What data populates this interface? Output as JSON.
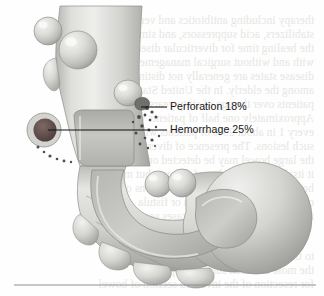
{
  "figure": {
    "name": "diverticular-disease-complications",
    "background_color": "#fefefe",
    "illustration_style": "grayscale medical airbrush illustration"
  },
  "callouts": [
    {
      "id": "perforation",
      "label": "Perforation 18%",
      "value": 18,
      "unit": "%",
      "leader_from": {
        "x": 141,
        "y": 107
      },
      "leader_to": {
        "x": 167,
        "y": 107
      },
      "target": "ruptured diverticulum with spilled contents"
    },
    {
      "id": "hemorrhage",
      "label": "Hemorrhage 25%",
      "value": 25,
      "unit": "%",
      "leader_from": {
        "x": 48,
        "y": 130
      },
      "leader_to": {
        "x": 167,
        "y": 130
      },
      "target": "dark bleeding diverticular lesion"
    }
  ],
  "rule": {
    "name": "page-footer-rule",
    "y": 285,
    "x_start": 14,
    "x_end": 316,
    "color": "#8e8e96"
  },
  "palette": {
    "bowel_light": "#e3e3e0",
    "bowel_mid": "#c9c9c6",
    "bowel_shadow": "#a9a9a6",
    "bowel_deep": "#8e8e8b",
    "lumen": "#bdbdba",
    "lesion_dark": "#5d4c4a",
    "lesion_ring": "#cfcfcb",
    "particle": "#4a4a48",
    "leader_line": "#101010",
    "bleed_text": "#e6e6e2",
    "page": "#fefefe"
  },
  "bleed_through_text": {
    "note": "faint mirrored show-through text from reverse of printed page",
    "lines": [
      {
        "text": "therapy including antibiotics and very occasionally",
        "x": 10,
        "y": 14,
        "size": 11.6
      },
      {
        "text": "stabilizers, acid suppressors, and similar agents",
        "x": 10,
        "y": 28,
        "size": 11.6
      },
      {
        "text": "the healing time for diverticular disease after",
        "x": 10,
        "y": 42,
        "size": 11.6
      },
      {
        "text": "with and without surgical management and",
        "x": 10,
        "y": 56,
        "size": 11.6
      },
      {
        "text": "disease states are generally not distinctly",
        "x": 10,
        "y": 70,
        "size": 11.6
      },
      {
        "text": "among the elderly. In the United States, the",
        "x": 10,
        "y": 84,
        "size": 11.6
      },
      {
        "text": "patients over the age of sixty years, the risk",
        "x": 10,
        "y": 98,
        "size": 11.6
      },
      {
        "text": "Approximately one half of patients with",
        "x": 10,
        "y": 112,
        "size": 11.6
      },
      {
        "text": "every 1 in about 25% of patients will have",
        "x": 10,
        "y": 126,
        "size": 11.6
      },
      {
        "text": "such lesions. The presence of diverticula in",
        "x": 10,
        "y": 140,
        "size": 11.6
      },
      {
        "text": "the large bowel may be detected on barium",
        "x": 10,
        "y": 154,
        "size": 11.6
      },
      {
        "text": "it itself is not a marker of disease, but may",
        "x": 10,
        "y": 168,
        "size": 11.6
      },
      {
        "text": "herald more significant complications of the",
        "x": 10,
        "y": 182,
        "size": 11.6
      },
      {
        "text": "colon including obstruction or fistula",
        "x": 10,
        "y": 196,
        "size": 11.6
      },
      {
        "text": "formation in a minority of cases seen",
        "x": 10,
        "y": 210,
        "size": 11.6
      },
      {
        "text": "to the prevention of inflammation of",
        "x": 10,
        "y": 250,
        "size": 11.6
      },
      {
        "text": "the most common surgical approach",
        "x": 10,
        "y": 264,
        "size": 11.6
      },
      {
        "text": "for resection of the involved section of bowel",
        "x": 10,
        "y": 278,
        "size": 11.6
      }
    ]
  }
}
